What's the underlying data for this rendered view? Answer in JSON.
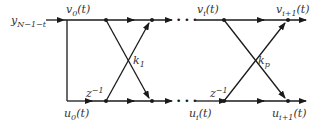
{
  "diagram": {
    "type": "lattice-filter",
    "colors": {
      "line": "#1a1a1a",
      "text": "#333333",
      "background": "#ffffff"
    },
    "input": {
      "label_main": "y",
      "label_sub": "N−1−t"
    },
    "top_labels": [
      {
        "main": "v",
        "sub": "0",
        "arg": "(t)"
      },
      {
        "main": "v",
        "sub": "i",
        "arg": "(t)"
      },
      {
        "main": "v",
        "sub": "i+1",
        "arg": "(t)"
      }
    ],
    "bottom_labels": [
      {
        "main": "u",
        "sub": "0",
        "arg": "(t)"
      },
      {
        "main": "u",
        "sub": "i",
        "arg": "(t)"
      },
      {
        "main": "u",
        "sub": "i+1",
        "arg": "(t)"
      }
    ],
    "stages": [
      {
        "coef_main": "k",
        "coef_sub": "1",
        "delay": "z",
        "delay_sup": "−1"
      },
      {
        "coef_main": "k",
        "coef_sub": "p",
        "delay": "z",
        "delay_sup": "−1"
      }
    ],
    "ellipsis": "• • •"
  }
}
